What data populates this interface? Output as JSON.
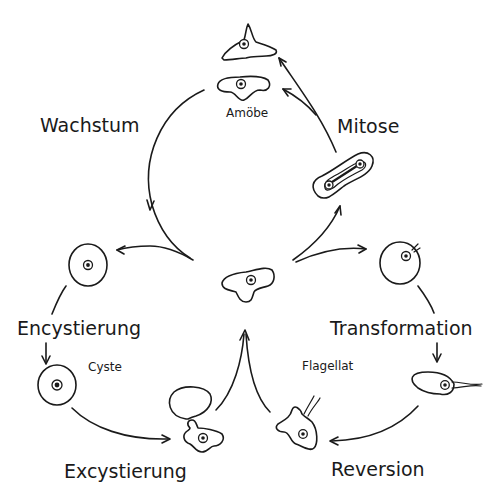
{
  "diagram": {
    "process_labels": {
      "wachstum": "Wachstum",
      "mitose": "Mitose",
      "encystierung": "Encystierung",
      "transformation": "Transformation",
      "excystierung": "Excystierung",
      "reversion": "Reversion"
    },
    "stage_labels": {
      "amoebe": "Amöbe",
      "cyste": "Cyste",
      "flagellat": "Flagellat"
    },
    "stroke_color": "#1a1a1a",
    "background_color": "#ffffff"
  }
}
